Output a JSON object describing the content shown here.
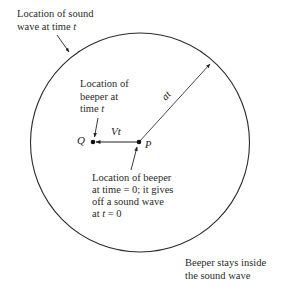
{
  "diagram": {
    "circle": {
      "cx": 140,
      "cy": 142.5,
      "r": 109.5,
      "label": "Location of sound wave at time t"
    },
    "points": {
      "P": {
        "label": "P",
        "x": 139,
        "y": 142
      },
      "Q": {
        "label": "Q",
        "x": 93,
        "y": 142
      }
    },
    "vectors": {
      "Vt": {
        "label": "Vt",
        "from": "P",
        "to": "Q"
      },
      "at": {
        "label": "at",
        "from": "P",
        "to_circle_point": [
          211,
          63
        ]
      }
    },
    "labels": {
      "sound_wave": {
        "line1": "Location of sound",
        "line2_prefix": "wave at time ",
        "line2_var": "t"
      },
      "beeper_t": {
        "line1": "Location of",
        "line2": "beeper at",
        "line3_prefix": "time ",
        "line3_var": "t"
      },
      "beeper_0": {
        "line1": "Location of beeper",
        "line2": "at time = 0; it gives",
        "line3": "off a sound wave",
        "line4_prefix": "at ",
        "line4_var": "t",
        "line4_suffix": " = 0"
      },
      "stays_inside": {
        "line1": "Beeper stays inside",
        "line2": "the sound wave"
      }
    },
    "colors": {
      "stroke": "#2a2a2a",
      "text": "#2a2a2a",
      "background": "#ffffff"
    }
  }
}
